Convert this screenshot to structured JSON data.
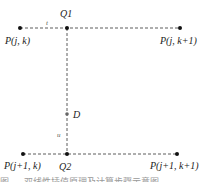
{
  "diagram": {
    "points": {
      "p_jk": {
        "label": "P(j, k)",
        "x": 20,
        "y": 28
      },
      "p_jk1": {
        "label": "P(j, k+1)",
        "x": 180,
        "y": 28
      },
      "q1": {
        "label": "Q1",
        "x": 67,
        "y": 28
      },
      "d": {
        "label": "D",
        "x": 67,
        "y": 114
      },
      "p_j1k": {
        "label": "P(j+1, k)",
        "x": 23,
        "y": 154
      },
      "q2": {
        "label": "Q2",
        "x": 67,
        "y": 154
      },
      "p_j1k1": {
        "label": "P(j+1, k+1)",
        "x": 177,
        "y": 154
      }
    },
    "segment_labels": {
      "t": "t",
      "u": "u"
    },
    "caption": "图 … 双线性插值原理及计算步骤示意图"
  }
}
